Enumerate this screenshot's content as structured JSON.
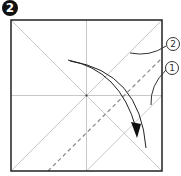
{
  "step": {
    "number": "2"
  },
  "labels": {
    "first": "1",
    "second": "2"
  },
  "colors": {
    "border": "#222222",
    "crease": "#c8c8c8",
    "dash": "#888888",
    "arrow": "#222222"
  }
}
